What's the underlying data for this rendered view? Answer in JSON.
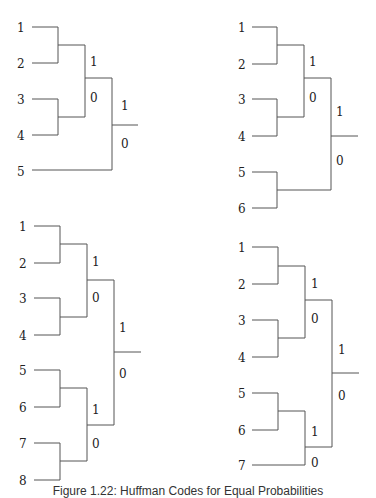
{
  "figure": {
    "caption": "Figure 1.22: Huffman Codes for Equal Probabilities",
    "line_color": "#555555",
    "trees": [
      {
        "id": "tree-5",
        "leaves": [
          "1",
          "2",
          "3",
          "4",
          "5"
        ],
        "bits": {
          "upper": "1",
          "lower": "0"
        }
      },
      {
        "id": "tree-6",
        "leaves": [
          "1",
          "2",
          "3",
          "4",
          "5",
          "6"
        ],
        "bits": {
          "upper": "1",
          "lower": "0"
        }
      },
      {
        "id": "tree-8",
        "leaves": [
          "1",
          "2",
          "3",
          "4",
          "5",
          "6",
          "7",
          "8"
        ],
        "bits": {
          "upper": "1",
          "lower": "0"
        }
      },
      {
        "id": "tree-7",
        "leaves": [
          "1",
          "2",
          "3",
          "4",
          "5",
          "6",
          "7"
        ],
        "bits": {
          "upper": "1",
          "lower": "0"
        }
      }
    ]
  }
}
